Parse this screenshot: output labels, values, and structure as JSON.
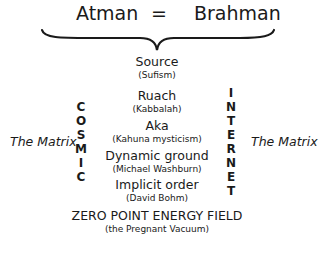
{
  "header": {
    "left": "Atman",
    "equals": "=",
    "right": "Brahman"
  },
  "levels": [
    {
      "name": "Source",
      "source": "(Sufism)"
    },
    {
      "name": "Ruach",
      "source": "(Kabbalah)"
    },
    {
      "name": "Aka",
      "source": "(Kahuna mysticism)"
    },
    {
      "name": "Dynamic ground",
      "source": "(Michael Washburn)"
    },
    {
      "name": "Implicit order",
      "source": "(David Bohm)"
    }
  ],
  "base": {
    "name": "ZERO POINT ENERGY FIELD",
    "source": "(the Pregnant Vacuum)"
  },
  "left_column": {
    "letters": [
      "C",
      "O",
      "S",
      "M",
      "I",
      "C"
    ],
    "word": "COSMIC"
  },
  "right_column": {
    "letters": [
      "I",
      "N",
      "T",
      "E",
      "R",
      "N",
      "E",
      "T"
    ],
    "word": "INTERNET"
  },
  "side_labels": {
    "left": "The Matrix",
    "right": "The Matrix"
  }
}
